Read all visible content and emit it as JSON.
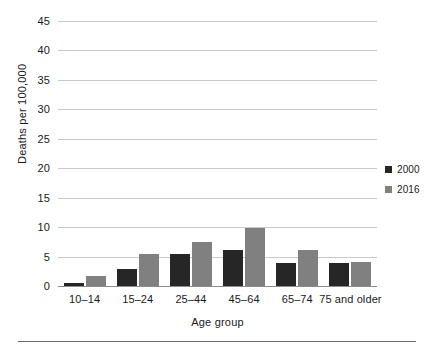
{
  "chart_data": {
    "type": "bar",
    "title": "",
    "xlabel": "Age group",
    "ylabel": "Deaths per 100,000",
    "categories": [
      "10–14",
      "15–24",
      "25–44",
      "45–64",
      "65–74",
      "75 and older"
    ],
    "series": [
      {
        "name": "2000",
        "color": "#262626",
        "values": [
          0.5,
          2.9,
          5.4,
          6.1,
          3.9,
          3.9
        ]
      },
      {
        "name": "2016",
        "color": "#808080",
        "values": [
          1.7,
          5.4,
          7.5,
          9.9,
          6.1,
          4.1
        ]
      }
    ],
    "ylim": [
      0,
      45
    ],
    "yticks": [
      0,
      5,
      10,
      15,
      20,
      25,
      30,
      35,
      40,
      45
    ],
    "ytick_labels": [
      "0",
      "5",
      "10",
      "15",
      "20",
      "25",
      "30",
      "35",
      "40",
      "45"
    ],
    "grid": "horizontal",
    "legend_position": "right"
  }
}
